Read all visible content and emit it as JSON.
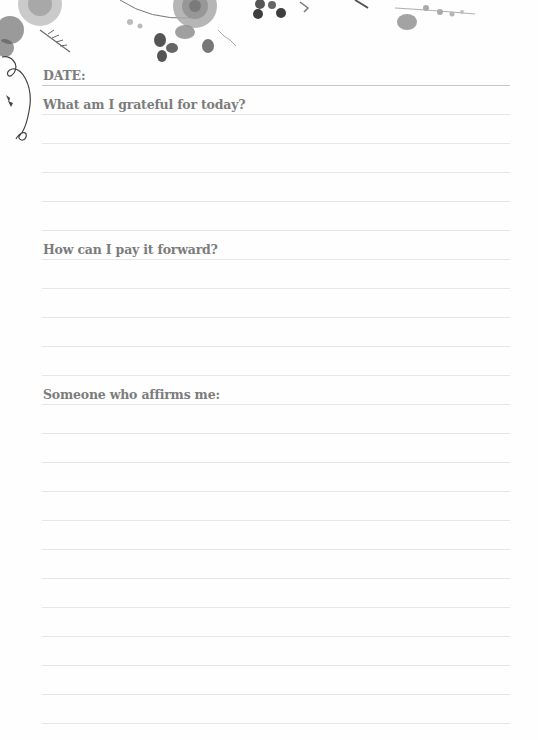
{
  "page": {
    "date_label": "DATE:",
    "sections": [
      {
        "id": "grateful",
        "heading": "What am I grateful for today?",
        "lines": 4
      },
      {
        "id": "pay-forward",
        "heading": "How can I pay it forward?",
        "lines": 4
      },
      {
        "id": "affirms",
        "heading": "Someone who affirms me:",
        "lines": 11
      }
    ],
    "decoration": {
      "top_border": "floral-watercolor-grayscale",
      "side_ornament": "curling-vine"
    },
    "colors": {
      "heading_text": "#7c7c7c",
      "rule_line": "#e6e6e6",
      "date_rule": "#c9c9c9",
      "background": "#fefefe"
    }
  }
}
